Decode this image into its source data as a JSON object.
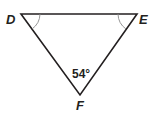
{
  "diagram": {
    "type": "triangle",
    "vertices": [
      {
        "label": "D",
        "x": 21,
        "y": 14
      },
      {
        "label": "E",
        "x": 137,
        "y": 14
      },
      {
        "label": "F",
        "x": 80,
        "y": 95
      }
    ],
    "angle_label": "54°",
    "angle_vertex": "F",
    "marked_angles": [
      "D",
      "E"
    ],
    "colors": {
      "line": "#231f20",
      "arc": "#8a8a8a"
    }
  }
}
